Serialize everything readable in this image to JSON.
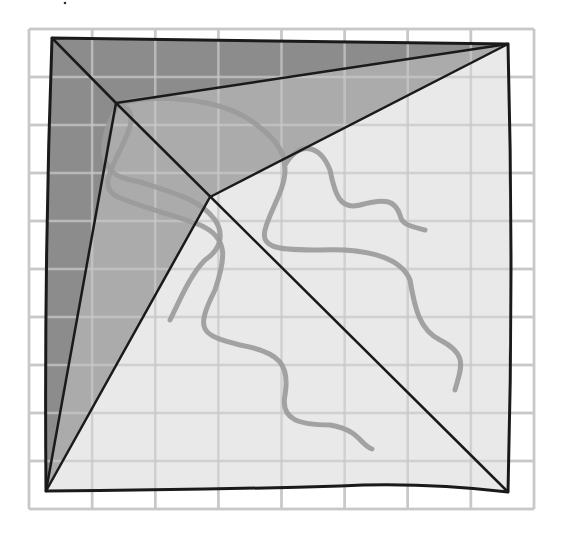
{
  "diagram": {
    "canvas": {
      "width": 562,
      "height": 536,
      "background": "#ffffff"
    },
    "grid": {
      "x0": 29,
      "y0": 29,
      "x1": 534,
      "y1": 509,
      "columns": 8,
      "rows": 10,
      "color": "#c8c8c8"
    },
    "colors": {
      "dark_region": "#8c8c8c",
      "mid_region": "#ababab",
      "light_region": "#e9e9e9",
      "outline": "#1a1a1a",
      "curve": "#9a9a9a"
    },
    "vertices": {
      "top_left": [
        52,
        38
      ],
      "top_right": [
        508,
        44
      ],
      "bottom_right": [
        508,
        492
      ],
      "bottom_left": [
        46,
        491
      ],
      "inner_a": [
        116,
        103
      ],
      "inner_b": [
        210,
        197
      ]
    },
    "regions": [
      {
        "name": "dark-region",
        "fill": "dark_region"
      },
      {
        "name": "mid-region",
        "fill": "mid_region"
      },
      {
        "name": "light-region",
        "fill": "light_region"
      }
    ],
    "curves": 3,
    "top_mark": "·"
  }
}
